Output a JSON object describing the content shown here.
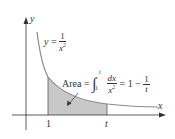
{
  "axes": {
    "x_label": "x",
    "y_label": "y"
  },
  "curve_label": {
    "lhs": "y",
    "eq": "=",
    "num": "1",
    "den": "x",
    "den_exp": "2"
  },
  "area_label": {
    "text": "Area =",
    "integral": "∫",
    "upper": "t",
    "lower": "1",
    "num": "dx",
    "den": "x",
    "den_exp": "2",
    "eq_rhs": "= 1 −",
    "rhs_num": "1",
    "rhs_den": "t"
  },
  "ticks": {
    "a": "1",
    "b": "t"
  },
  "colors": {
    "curve": "#8a8a8a",
    "shade": "#c8c8c8",
    "axis": "#333333"
  }
}
